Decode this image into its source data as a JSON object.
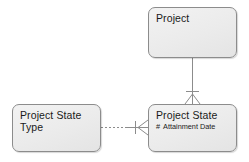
{
  "diagram": {
    "type": "entity-relationship-diagram",
    "notation": "barker",
    "background_color": "#ffffff",
    "entity_fill_color": "#ebebeb",
    "entity_border_color": "#8c8c8c",
    "text_color": "#1a1a1a",
    "line_color": "#8c8c8c",
    "entities": [
      {
        "id": "project",
        "name": "Project",
        "attributes": []
      },
      {
        "id": "project-state-type",
        "name": "Project State\nType",
        "attributes": []
      },
      {
        "id": "project-state",
        "name": "Project State",
        "attributes": [
          {
            "marker": "#",
            "label": "Attainment Date"
          }
        ]
      }
    ],
    "relationships": [
      {
        "id": "project-to-project-state",
        "from": "project",
        "to": "project-state",
        "line_style": "solid",
        "orientation": "vertical",
        "from_end": "one-mandatory-bar",
        "to_end": "many-crowsfoot"
      },
      {
        "id": "project-state-type-to-project-state",
        "from": "project-state-type",
        "to": "project-state",
        "line_style": "dashed",
        "orientation": "horizontal",
        "from_end": "plain",
        "to_end": "many-crowsfoot-with-bar"
      }
    ]
  }
}
